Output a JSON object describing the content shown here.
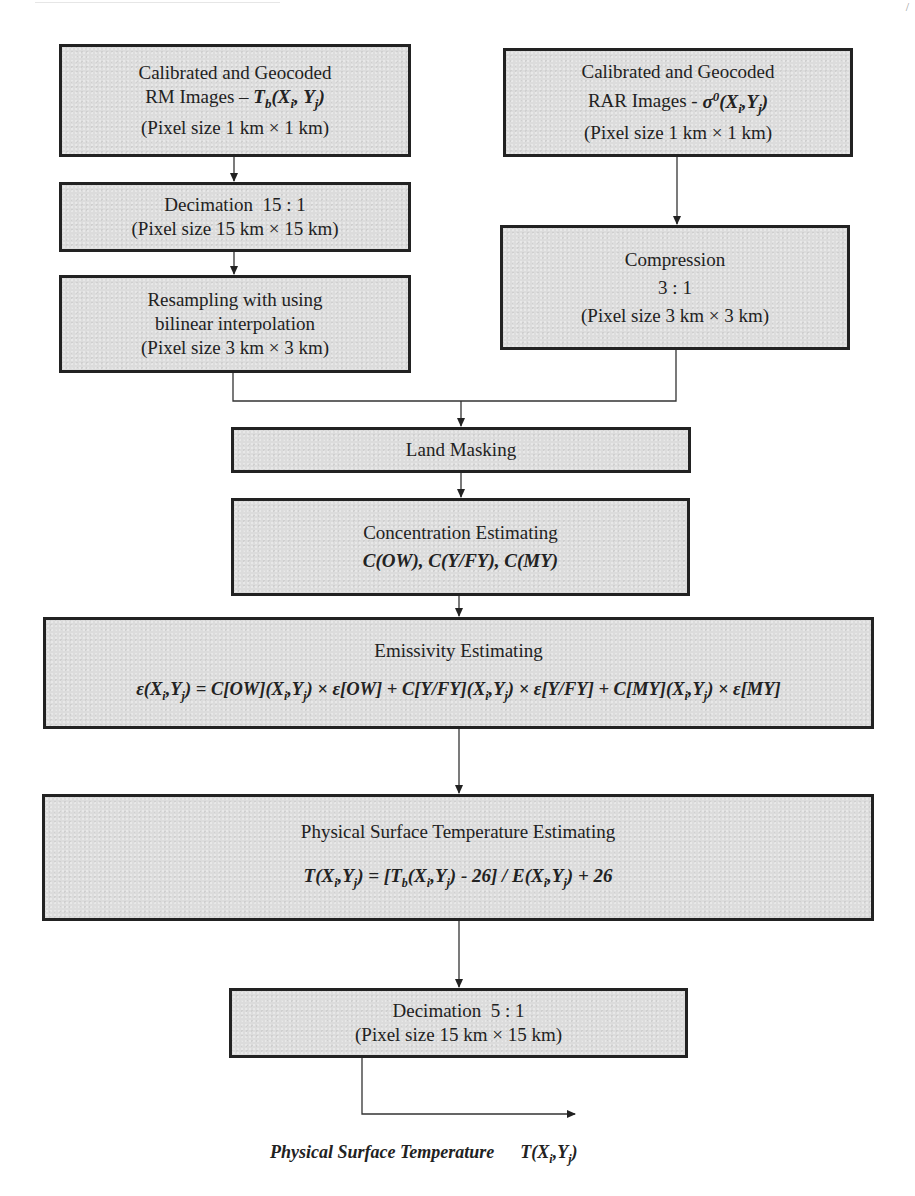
{
  "diagram": {
    "type": "flowchart",
    "nodes": [
      {
        "id": "rm_images",
        "lines": [
          "Calibrated and Geocoded"
        ],
        "line2_prefix": "RM Images – ",
        "line2_math": "T",
        "line2_sub": "b",
        "line2_args": "(X",
        "line2_i": "i",
        "line2_mid": ", Y",
        "line2_j": "j",
        "line2_end": ")",
        "line3": "(Pixel size 1 km × 1 km)"
      },
      {
        "id": "rar_images",
        "line1": "Calibrated and Geocoded",
        "line2_prefix": "RAR Images - ",
        "line2_math": "σ",
        "line2_sup": "0",
        "line2_args": "(X",
        "line2_i": "i",
        "line2_mid": ", Y",
        "line2_j": "j",
        "line2_end": ")",
        "line3": "(Pixel size 1 km × 1 km)"
      },
      {
        "id": "decimation_15",
        "line1": "Decimation  15 : 1",
        "line2": "(Pixel size 15 km × 15 km)"
      },
      {
        "id": "resampling",
        "line1": "Resampling with using",
        "line2": "bilinear interpolation",
        "line3": "(Pixel size 3 km × 3 km)"
      },
      {
        "id": "compression",
        "line1": "Compression",
        "line2": "3 : 1",
        "line3": "(Pixel size 3 km × 3 km)"
      },
      {
        "id": "land_masking",
        "line1": "Land Masking"
      },
      {
        "id": "concentration",
        "line1": "Concentration Estimating",
        "line2": "C(OW), C(Y/FY), C(MY)"
      },
      {
        "id": "emissivity",
        "line1": "Emissivity Estimating",
        "line2": "ε(Xᵢ,Yⱼ) = C[OW](Xᵢ,Yⱼ) × ε[OW] + C[Y/FY](Xᵢ,Yⱼ) × ε[Y/FY] + C[MY](Xᵢ,Yⱼ) × ε[MY]"
      },
      {
        "id": "physical_temp",
        "line1": "Physical Surface Temperature Estimating",
        "line2": "T(Xᵢ,Yⱼ) = [Tₕ(Xᵢ,Yⱼ) - 26] / E(Xᵢ,Yⱼ) + 26"
      },
      {
        "id": "decimation_5",
        "line1": "Decimation  5 : 1",
        "line2": "(Pixel size 15 km × 15 km)"
      }
    ],
    "edges": [
      [
        "rm_images",
        "decimation_15"
      ],
      [
        "decimation_15",
        "resampling"
      ],
      [
        "rar_images",
        "compression"
      ],
      [
        "resampling",
        "land_masking"
      ],
      [
        "compression",
        "land_masking"
      ],
      [
        "land_masking",
        "concentration"
      ],
      [
        "concentration",
        "emissivity"
      ],
      [
        "emissivity",
        "physical_temp"
      ],
      [
        "physical_temp",
        "decimation_5"
      ],
      [
        "decimation_5",
        "output"
      ]
    ],
    "output": {
      "label": "Physical Surface Temperature",
      "symbol": "T(Xᵢ,Yⱼ)"
    }
  },
  "text": {
    "rm1": "Calibrated and Geocoded",
    "rm2a": "RM Images – ",
    "rm3": "(Pixel size 1 km × 1 km)",
    "rar1": "Calibrated and Geocoded",
    "rar2a": "RAR Images - ",
    "rar3": "(Pixel size 1 km × 1 km)",
    "dec15_1": "Decimation  15 : 1",
    "dec15_2": "(Pixel size 15 km × 15 km)",
    "res1": "Resampling with using",
    "res2": "bilinear interpolation",
    "res3": "(Pixel size 3 km × 3 km)",
    "comp1": "Compression",
    "comp2": "3 : 1",
    "comp3": "(Pixel size 3 km × 3 km)",
    "land": "Land Masking",
    "conc1": "Concentration Estimating",
    "conc2": "C(OW), C(Y/FY), C(MY)",
    "emis1": "Emissivity Estimating",
    "phys1": "Physical Surface Temperature Estimating",
    "dec5_1": "Decimation  5 : 1",
    "dec5_2": "(Pixel size 15 km × 15 km)",
    "final_label": "Physical Surface Temperature",
    "page_mark": "/"
  }
}
